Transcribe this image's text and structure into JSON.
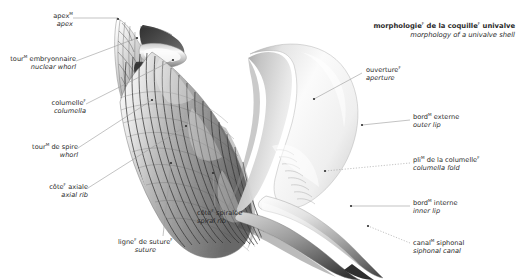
{
  "title": {
    "fr_pre": "morphologie",
    "fr_sup": "F",
    "fr_post": " de la coquille",
    "fr_sup2": "F",
    "fr_end": " univalve",
    "en": "morphology of a univalve shell"
  },
  "colors": {
    "background": "#ffffff",
    "text": "#2a2a2a",
    "leader_line": "#9a9a9a",
    "shell_light": "#fdfdfd",
    "shell_mid": "#bdbdbd",
    "shell_dark": "#6f6f6f",
    "shell_rib": "#3c3c3c"
  },
  "labels": [
    {
      "id": "apex",
      "fr": "apex",
      "fr_sup": "M",
      "fr_post": "",
      "en": "apex",
      "align": "r",
      "x": 10,
      "y": 12,
      "anchor_x": 110,
      "anchor_y": 18,
      "dot_x": 117,
      "dot_y": 20,
      "dotted": false
    },
    {
      "id": "nuclear-whorl",
      "fr": "tour",
      "fr_sup": "M",
      "fr_post": " embryonnaire",
      "en": "nuclear whorl",
      "align": "r",
      "x": 10,
      "y": 56,
      "anchor_x": 130,
      "anchor_y": 40,
      "dot_x": 137,
      "dot_y": 37,
      "dotted": false
    },
    {
      "id": "columella",
      "fr": "columelle",
      "fr_sup": "F",
      "fr_post": "",
      "en": "columella",
      "align": "r",
      "x": 10,
      "y": 100,
      "anchor_x": 168,
      "anchor_y": 62,
      "dot_x": 173,
      "dot_y": 60,
      "dotted": false
    },
    {
      "id": "whorl",
      "fr": "tour",
      "fr_sup": "M",
      "fr_post": " de spire",
      "en": "whorl",
      "align": "r",
      "x": 10,
      "y": 144,
      "anchor_x": 146,
      "anchor_y": 102,
      "dot_x": 152,
      "dot_y": 100,
      "dotted": false
    },
    {
      "id": "axial-rib",
      "fr": "côte",
      "fr_sup": "F",
      "fr_post": " axiale",
      "en": "axial rib",
      "align": "r",
      "x": 10,
      "y": 184,
      "anchor_x": 180,
      "anchor_y": 128,
      "dot_x": 186,
      "dot_y": 126,
      "dotted": false
    },
    {
      "id": "suture",
      "fr": "ligne",
      "fr_sup": "F",
      "fr_post": " de suture",
      "fr_sup2": "F",
      "en": "suture",
      "align": "l",
      "x": 118,
      "y": 239,
      "anchor_x": 171,
      "anchor_y": 164,
      "dot_x": 171,
      "dot_y": 162,
      "dotted": false
    },
    {
      "id": "spiral-rib",
      "fr": "côte",
      "fr_sup": "F",
      "fr_post": " spiralée",
      "en": "spiral rib",
      "align": "l",
      "x": 197,
      "y": 210,
      "anchor_x": 212,
      "anchor_y": 174,
      "dot_x": 212,
      "dot_y": 172,
      "dotted": false
    },
    {
      "id": "aperture",
      "fr": "ouverture",
      "fr_sup": "F",
      "fr_post": "",
      "en": "aperture",
      "align": "l",
      "x": 366,
      "y": 67,
      "anchor_x": 314,
      "anchor_y": 99,
      "dot_x": 314,
      "dot_y": 99,
      "dotted": false
    },
    {
      "id": "outer-lip",
      "fr": "bord",
      "fr_sup": "M",
      "fr_post": " externe",
      "en": "outer lip",
      "align": "l",
      "x": 413,
      "y": 114,
      "anchor_x": 362,
      "anchor_y": 125,
      "dot_x": 362,
      "dot_y": 125,
      "dotted": false
    },
    {
      "id": "columella-fold",
      "fr": "pli",
      "fr_sup": "M",
      "fr_post": " de la columelle",
      "fr_sup2": "F",
      "en": "columella fold",
      "align": "l",
      "x": 413,
      "y": 157,
      "anchor_x": 325,
      "anchor_y": 171,
      "dot_x": 325,
      "dot_y": 171,
      "dotted": true
    },
    {
      "id": "inner-lip",
      "fr": "bord",
      "fr_sup": "M",
      "fr_post": " interne",
      "en": "inner lip",
      "align": "l",
      "x": 413,
      "y": 200,
      "anchor_x": 351,
      "anchor_y": 206,
      "dot_x": 351,
      "dot_y": 206,
      "dotted": false
    },
    {
      "id": "siphonal-canal",
      "fr": "canal",
      "fr_sup": "M",
      "fr_post": " siphonal",
      "en": "siphonal canal",
      "align": "l",
      "x": 413,
      "y": 240,
      "anchor_x": 368,
      "anchor_y": 226,
      "dot_x": 368,
      "dot_y": 226,
      "dotted": true
    }
  ],
  "figure": {
    "name": "univalve-seashell-cutaway-illustration"
  }
}
